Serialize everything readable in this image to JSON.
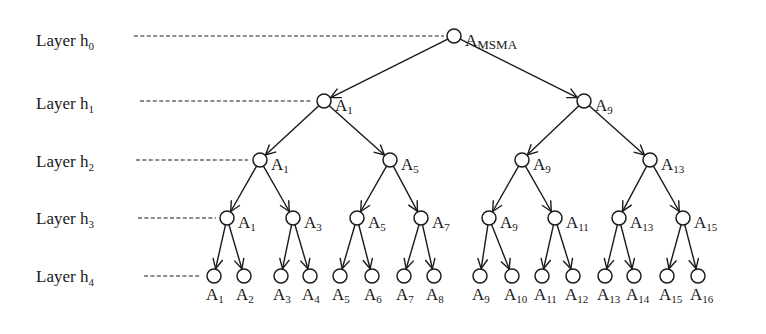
{
  "diagram": {
    "root": {
      "label": "A",
      "sub": "MSMA"
    },
    "layers": [
      {
        "label": "Layer h",
        "sub": "0",
        "nodes": [
          "MSMA"
        ]
      },
      {
        "label": "Layer h",
        "sub": "1",
        "nodes": [
          "1",
          "9"
        ]
      },
      {
        "label": "Layer h",
        "sub": "2",
        "nodes": [
          "1",
          "5",
          "9",
          "13"
        ]
      },
      {
        "label": "Layer h",
        "sub": "3",
        "nodes": [
          "1",
          "3",
          "5",
          "7",
          "9",
          "11",
          "13",
          "15"
        ]
      },
      {
        "label": "Layer h",
        "sub": "4",
        "nodes": [
          "1",
          "2",
          "3",
          "4",
          "5",
          "6",
          "7",
          "8",
          "9",
          "10",
          "11",
          "12",
          "13",
          "14",
          "15",
          "16"
        ]
      }
    ],
    "node_prefix": "A",
    "edges_directed": true,
    "colors": {
      "ink": "#1a1a1a",
      "background": "#ffffff"
    }
  }
}
